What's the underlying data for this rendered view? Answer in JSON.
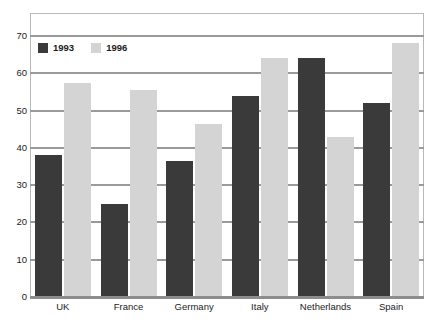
{
  "chart_data": {
    "type": "bar",
    "title": "",
    "subtitle": "",
    "xlabel": "",
    "ylabel": "",
    "categories": [
      "UK",
      "France",
      "Germany",
      "Italy",
      "Netherlands",
      "Spain"
    ],
    "series": [
      {
        "name": "1993",
        "color": "#3a3a3a",
        "values": [
          38,
          25,
          36.5,
          54,
          64,
          52
        ]
      },
      {
        "name": "1996",
        "color": "#d4d4d4",
        "values": [
          57.5,
          55.5,
          46.5,
          64,
          43,
          68
        ]
      }
    ],
    "ylim": [
      0,
      70
    ],
    "yticks": [
      0,
      10,
      20,
      30,
      40,
      50,
      60,
      70
    ],
    "ytick_labels": [
      "0",
      "10",
      "20",
      "30",
      "40",
      "50",
      "60",
      "70"
    ],
    "grid": true,
    "grid_axis": "y",
    "legend": {
      "position": "top-left-inside",
      "entries": [
        {
          "label": "1993",
          "swatch": "legend-swatch-1993"
        },
        {
          "label": "1996",
          "swatch": "legend-swatch-1996"
        }
      ]
    },
    "colors": {
      "series_1993": "#3a3a3a",
      "series_1996": "#d4d4d4",
      "gridline": "#9a9a9a",
      "axis": "#8d8d8d",
      "plot_border": "#b9b9b9",
      "background": "#ffffff",
      "text": "#1c1c1c"
    }
  }
}
